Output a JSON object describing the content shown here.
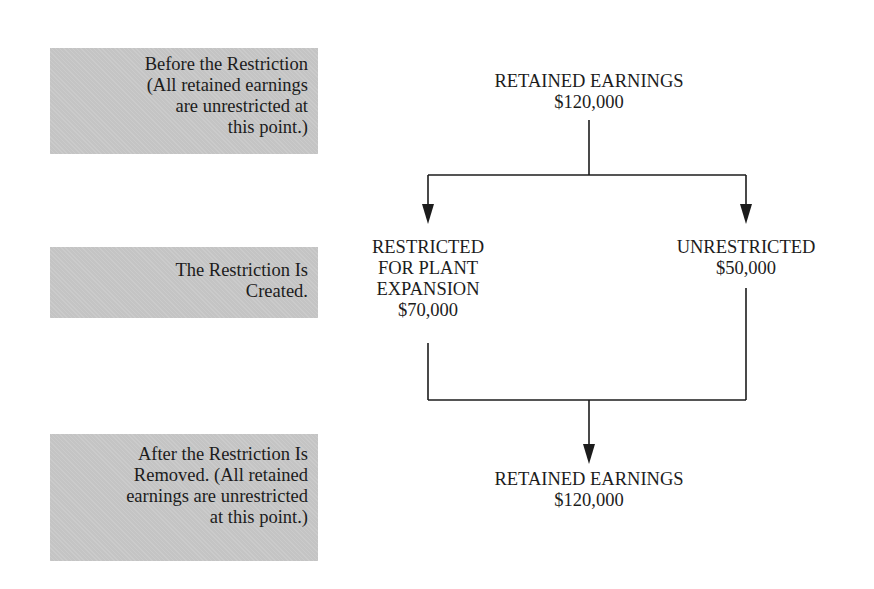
{
  "stages": [
    {
      "id": "before",
      "lines": [
        "Before the Restriction",
        "(All retained earnings",
        "are unrestricted at",
        "this point.)"
      ]
    },
    {
      "id": "created",
      "lines": [
        "The Restriction Is",
        "Created."
      ]
    },
    {
      "id": "after",
      "lines": [
        "After the Restriction Is",
        "Removed. (All retained",
        "earnings are unrestricted",
        "at this point.)"
      ]
    }
  ],
  "nodes": {
    "top": {
      "title": "RETAINED EARNINGS",
      "amount": "$120,000"
    },
    "restricted": {
      "lines": [
        "RESTRICTED",
        "FOR PLANT",
        "EXPANSION"
      ],
      "amount": "$70,000"
    },
    "unrestricted": {
      "title": "UNRESTRICTED",
      "amount": "$50,000"
    },
    "bottom": {
      "title": "RETAINED EARNINGS",
      "amount": "$120,000"
    }
  },
  "colors": {
    "stage_box": "#c4c4c4",
    "line": "#1c1c1c"
  }
}
